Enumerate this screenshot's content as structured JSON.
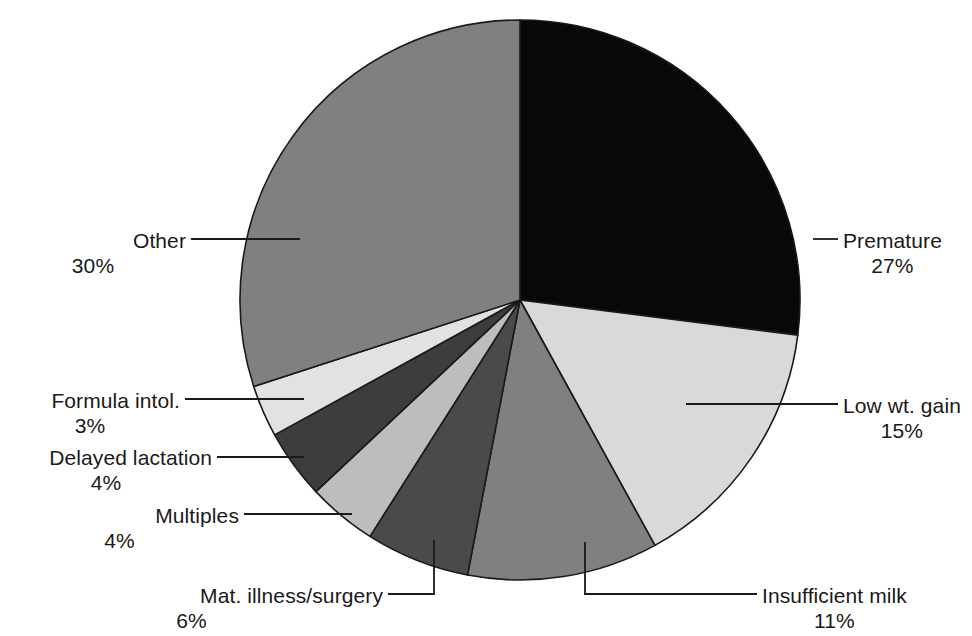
{
  "chart_data": {
    "type": "pie",
    "title": "",
    "subtitle": "",
    "xlabel": "",
    "ylabel": "",
    "legend_position": "none",
    "grid": false,
    "units": "percent",
    "start_angle_deg": 0,
    "direction": "clockwise",
    "categories": [
      "Premature",
      "Low wt. gain",
      "Insufficient milk",
      "Mat. illness/surgery",
      "Multiples",
      "Delayed lactation",
      "Formula intol.",
      "Other"
    ],
    "values": [
      27,
      15,
      11,
      6,
      4,
      4,
      3,
      30
    ],
    "slices": [
      {
        "label": "Premature",
        "value": 27,
        "value_text": "27%",
        "color": "#080808",
        "label_side": "right",
        "label_x": 843,
        "label_y": 228,
        "leader": {
          "type": "line",
          "x1": 813,
          "y1": 239,
          "x2": 838,
          "y2": 239
        }
      },
      {
        "label": "Low wt. gain",
        "value": 15,
        "value_text": "15%",
        "color": "#d9d9d9",
        "label_side": "right",
        "label_x": 843,
        "label_y": 393,
        "leader": {
          "type": "line",
          "x1": 686,
          "y1": 404,
          "x2": 838,
          "y2": 404
        }
      },
      {
        "label": "Insufficient milk",
        "value": 11,
        "value_text": "11%",
        "color": "#808080",
        "label_side": "right",
        "label_x": 762,
        "label_y": 583,
        "leader": {
          "type": "elbow",
          "x1": 585,
          "y1": 542,
          "x2": 585,
          "y2": 594,
          "x3": 757,
          "y3": 594
        }
      },
      {
        "label": "Mat. illness/surgery",
        "value": 6,
        "value_text": "6%",
        "color": "#4a4a4a",
        "label_side": "left",
        "label_x": 383,
        "label_y": 583,
        "leader": {
          "type": "elbow",
          "x1": 434,
          "y1": 540,
          "x2": 434,
          "y2": 594,
          "x3": 388,
          "y3": 594
        }
      },
      {
        "label": "Multiples",
        "value": 4,
        "value_text": "4%",
        "color": "#bdbdbd",
        "label_side": "left",
        "label_x": 239,
        "label_y": 503,
        "leader": {
          "type": "line",
          "x1": 244,
          "y1": 514,
          "x2": 352,
          "y2": 514
        }
      },
      {
        "label": "Delayed lactation",
        "value": 4,
        "value_text": "4%",
        "color": "#3d3d3d",
        "label_side": "left",
        "label_x": 212,
        "label_y": 445,
        "leader": {
          "type": "line",
          "x1": 217,
          "y1": 457,
          "x2": 304,
          "y2": 457
        }
      },
      {
        "label": "Formula intol.",
        "value": 3,
        "value_text": "3%",
        "color": "#e2e2e2",
        "label_side": "left",
        "label_x": 180,
        "label_y": 388,
        "leader": {
          "type": "line",
          "x1": 185,
          "y1": 399,
          "x2": 304,
          "y2": 399
        }
      },
      {
        "label": "Other",
        "value": 30,
        "value_text": "30%",
        "color": "#808080",
        "label_side": "left",
        "label_x": 186,
        "label_y": 228,
        "leader": {
          "type": "line",
          "x1": 191,
          "y1": 239,
          "x2": 300,
          "y2": 239
        }
      }
    ],
    "geometry": {
      "cx": 520,
      "cy": 300,
      "r": 280
    },
    "colors": {
      "background": "#ffffff",
      "outline": "#1a1a1a",
      "text": "#1a1a1a",
      "leader": "#1a1a1a"
    }
  }
}
